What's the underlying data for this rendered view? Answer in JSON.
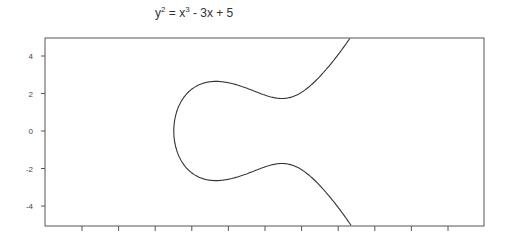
{
  "chart_data": {
    "type": "line",
    "title_parts": {
      "y": "y",
      "y_exp": "2",
      "eq": " = x",
      "x_exp": "3",
      "rest": " - 3x + 5"
    },
    "xlabel": "",
    "ylabel": "",
    "equation": {
      "a": -3,
      "b": 5
    },
    "xlim": [
      -3.45,
      7.2
    ],
    "ylim": [
      -5.05,
      5.0
    ],
    "yticks": [
      4,
      2,
      0,
      -2,
      -4
    ],
    "ytick_labels": [
      "4",
      "2",
      "0",
      "-2",
      "-4"
    ],
    "xtick_count": 11,
    "xticks": [
      -2.5,
      -1.5,
      -0.5,
      0.5,
      1.5,
      2.5,
      3.5,
      4.5,
      5.5,
      6.5,
      7.5
    ],
    "grid": false,
    "legend": "none",
    "series": [
      {
        "name": "y^2 = x^3 - 3x + 5",
        "color": "#333333",
        "x_range": [
          -2.279,
          3.05
        ]
      }
    ]
  }
}
